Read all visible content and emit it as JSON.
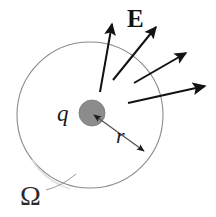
{
  "figure": {
    "labels": {
      "field_vector": "E",
      "charge": "q",
      "radius": "r",
      "surface": "Ω"
    },
    "colors": {
      "background": "#ffffff",
      "circle_stroke": "#8a8a8a",
      "charge_fill": "#8c8c8c",
      "charge_stroke": "#6f6f6f",
      "arrow": "#121212",
      "radius_line": "#555555",
      "leader_line": "#9a9a9a",
      "text": "#1a1a1a"
    },
    "geometry": {
      "canvas": {
        "width": 216,
        "height": 217
      },
      "gaussian_circle": {
        "cx": 90,
        "cy": 115,
        "r": 73,
        "stroke_width": 1.1
      },
      "charge_disc": {
        "cx": 92,
        "cy": 113,
        "r": 13
      },
      "radius_arrow": {
        "from": {
          "x": 92,
          "y": 113
        },
        "to": {
          "x": 146,
          "y": 153
        },
        "double_headed": true
      },
      "omega_leader": {
        "from": {
          "x": 48,
          "y": 191
        },
        "to": {
          "x": 74,
          "y": 176
        }
      },
      "field_arrows": [
        {
          "tail": {
            "x": 100,
            "y": 90
          },
          "tip": {
            "x": 113,
            "y": 16
          }
        },
        {
          "tail": {
            "x": 112,
            "y": 79
          },
          "tip": {
            "x": 160,
            "y": 20
          }
        },
        {
          "tail": {
            "x": 133,
            "y": 82
          },
          "tip": {
            "x": 190,
            "y": 49
          }
        },
        {
          "tail": {
            "x": 127,
            "y": 102
          },
          "tip": {
            "x": 210,
            "y": 85
          }
        }
      ]
    }
  }
}
